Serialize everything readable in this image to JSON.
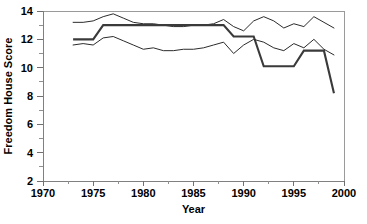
{
  "chart_data": {
    "type": "line",
    "title": "",
    "xlabel": "Year",
    "ylabel": "Freedom House Score",
    "xlim": [
      1970,
      2000
    ],
    "ylim": [
      2,
      14
    ],
    "grid": false,
    "legend": "none",
    "x_ticks": [
      1970,
      1975,
      1980,
      1985,
      1990,
      1995,
      2000
    ],
    "x_minor_ticks": [
      1972.5,
      1977.5,
      1982.5,
      1987.5,
      1992.5,
      1997.5
    ],
    "y_ticks": [
      2,
      4,
      6,
      8,
      10,
      12,
      14
    ],
    "y_minor_ticks": [
      3,
      5,
      7,
      9,
      11,
      13
    ],
    "x": [
      1973,
      1974,
      1975,
      1976,
      1977,
      1978,
      1979,
      1980,
      1981,
      1982,
      1983,
      1984,
      1985,
      1986,
      1987,
      1988,
      1989,
      1990,
      1991,
      1992,
      1993,
      1994,
      1995,
      1996,
      1997,
      1998,
      1999
    ],
    "series": [
      {
        "name": "upper-thin-line",
        "style": "thin",
        "values": [
          13.2,
          13.2,
          13.3,
          13.6,
          13.8,
          13.5,
          13.2,
          13.1,
          13.1,
          13.0,
          12.9,
          12.9,
          13.0,
          13.0,
          13.1,
          13.4,
          12.9,
          12.6,
          13.3,
          13.6,
          13.3,
          12.8,
          13.1,
          12.9,
          13.6,
          13.2,
          12.8
        ]
      },
      {
        "name": "middle-thick-line",
        "style": "thick",
        "values": [
          12.0,
          12.0,
          12.0,
          13.0,
          13.0,
          13.0,
          13.0,
          13.0,
          13.0,
          13.0,
          13.0,
          13.0,
          13.0,
          13.0,
          13.0,
          13.0,
          12.2,
          12.2,
          12.2,
          10.1,
          10.1,
          10.1,
          10.1,
          11.2,
          11.2,
          11.2,
          8.2
        ]
      },
      {
        "name": "lower-thin-line",
        "style": "thin",
        "values": [
          11.6,
          11.7,
          11.6,
          12.1,
          12.2,
          11.9,
          11.6,
          11.3,
          11.4,
          11.2,
          11.2,
          11.3,
          11.3,
          11.4,
          11.6,
          11.8,
          11.0,
          11.6,
          12.0,
          11.8,
          11.4,
          11.2,
          11.7,
          11.4,
          12.0,
          11.3,
          10.9
        ]
      }
    ]
  },
  "axis": {
    "y_tick_labels": [
      "14",
      "12",
      "10",
      "8",
      "6",
      "4",
      "2"
    ],
    "x_tick_labels": [
      "1970",
      "1975",
      "1980",
      "1985",
      "1990",
      "1995",
      "2000"
    ],
    "x_axis_title": "Year",
    "y_axis_title": "Freedom House Score"
  }
}
